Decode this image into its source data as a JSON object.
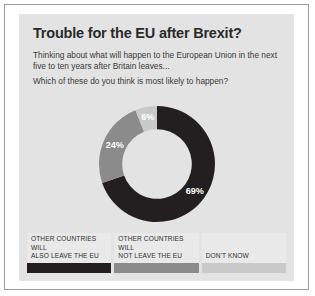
{
  "title": "Trouble for the EU after Brexit?",
  "intro": "Thinking about what will happen to the European Union in the next five to ten years after Britain leaves...",
  "question": "Which of these do you think is most likely to happen?",
  "colors": {
    "panel": "#e3e3e3",
    "page": "#ffffff",
    "border": "#9b9b9b",
    "dark": "#231f20",
    "mid": "#8b8b8b",
    "light": "#c9c9c9",
    "label": "#ffffff"
  },
  "legend": [
    {
      "line1": "OTHER COUNTRIES",
      "line2": "WILL",
      "line3": "ALSO LEAVE THE EU",
      "color": "#231f20"
    },
    {
      "line1": "OTHER COUNTRIES",
      "line2": "WILL",
      "line3": "NOT LEAVE THE EU",
      "color": "#8b8b8b"
    },
    {
      "line1": "",
      "line2": "",
      "line3": "DON'T KNOW",
      "color": "#c9c9c9"
    }
  ],
  "chart_data": {
    "type": "pie",
    "variant": "donut",
    "title": "Trouble for the EU after Brexit?",
    "categories": [
      "OTHER COUNTRIES WILL ALSO LEAVE THE EU",
      "OTHER COUNTRIES WILL NOT LEAVE THE EU",
      "DON'T KNOW"
    ],
    "values": [
      69,
      24,
      6
    ],
    "labels": [
      "69%",
      "24%",
      "6%"
    ],
    "colors": [
      "#231f20",
      "#8b8b8b",
      "#c9c9c9"
    ],
    "units": "percent",
    "legend_position": "bottom",
    "grid": false,
    "start_angle_deg": 0,
    "direction": "clockwise",
    "inner_radius_ratio": 0.6
  }
}
